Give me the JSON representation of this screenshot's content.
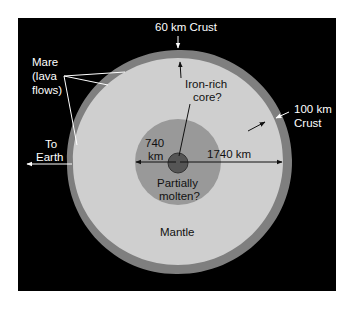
{
  "diagram": {
    "type": "cross-section",
    "colors": {
      "background": "#000000",
      "crust": "#7f7f7f",
      "mantle": "#cfcfcf",
      "inner_zone": "#999999",
      "core": "#555555",
      "label_light": "#ffffff",
      "label_dark": "#111111"
    },
    "labels": {
      "crust_top": "60 km Crust",
      "mare_line1": "Mare",
      "mare_line2": "(lava",
      "mare_line3": "flows)",
      "to_earth_line1": "To",
      "to_earth_line2": "Earth",
      "core_line1": "Iron-rich",
      "core_line2": "core?",
      "crust_right_line1": "100 km",
      "crust_right_line2": "Crust",
      "inner_radius_line1": "740",
      "inner_radius_line2": "km",
      "outer_radius": "1740 km",
      "molten_line1": "Partially",
      "molten_line2": "molten?",
      "mantle": "Mantle"
    }
  }
}
